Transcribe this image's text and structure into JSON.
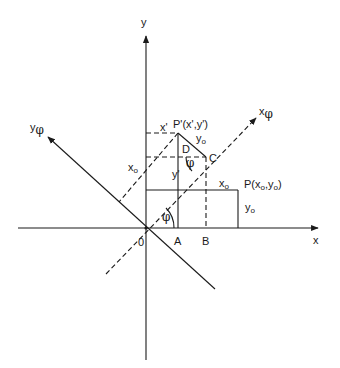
{
  "diagram": {
    "axes": {
      "x": {
        "label": "x"
      },
      "y": {
        "label": "y"
      },
      "x_phi": {
        "label": "x",
        "sub": "φ"
      },
      "y_phi": {
        "label": "y",
        "sub": "φ"
      }
    },
    "points": {
      "origin": {
        "label": "0"
      },
      "A": {
        "label": "A"
      },
      "B": {
        "label": "B"
      },
      "C": {
        "label": "C"
      },
      "D": {
        "label": "D"
      },
      "P": {
        "label": "P(x",
        "sub1": "o",
        "mid": ",y",
        "sub2": "o",
        "end": ")"
      },
      "P_prime": {
        "label": "P'(x',y')"
      }
    },
    "segment_labels": {
      "x_prime": "x'",
      "y_prime": "y'",
      "xo_top": {
        "label": "x",
        "sub": "o"
      },
      "yo_right": {
        "label": "y",
        "sub": "o"
      },
      "yo_upper": {
        "label": "y",
        "sub": "o"
      },
      "xo_left": {
        "label": "x",
        "sub": "o"
      }
    },
    "angles": {
      "phi_origin": "φ",
      "phi_c": "φ"
    },
    "colors": {
      "ink": "#1a1a1a",
      "background": "#ffffff"
    }
  }
}
